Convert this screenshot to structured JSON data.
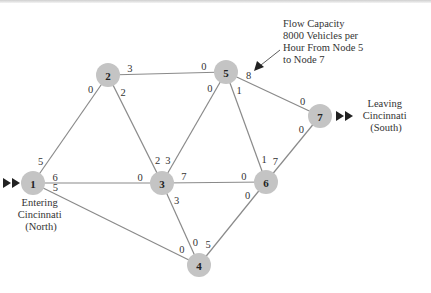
{
  "diagram": {
    "nodes": [
      {
        "id": "1",
        "x": 33,
        "y": 183
      },
      {
        "id": "2",
        "x": 108,
        "y": 75
      },
      {
        "id": "3",
        "x": 162,
        "y": 183
      },
      {
        "id": "4",
        "x": 199,
        "y": 265
      },
      {
        "id": "5",
        "x": 226,
        "y": 72
      },
      {
        "id": "6",
        "x": 266,
        "y": 182
      },
      {
        "id": "7",
        "x": 320,
        "y": 116
      }
    ],
    "edges": [
      {
        "from": "1",
        "to": "2",
        "cap_from": "5",
        "cap_to": "0"
      },
      {
        "from": "1",
        "to": "3",
        "cap_from": "6",
        "cap_to": "0"
      },
      {
        "from": "1",
        "to": "4",
        "cap_from": "5",
        "cap_to": "0"
      },
      {
        "from": "2",
        "to": "3",
        "cap_from": "2",
        "cap_to": "2"
      },
      {
        "from": "2",
        "to": "5",
        "cap_from": "3",
        "cap_to": "0"
      },
      {
        "from": "3",
        "to": "5",
        "cap_from": "3",
        "cap_to": "0"
      },
      {
        "from": "3",
        "to": "6",
        "cap_from": "7",
        "cap_to": "0"
      },
      {
        "from": "3",
        "to": "4",
        "cap_from": "3",
        "cap_to": "0"
      },
      {
        "from": "4",
        "to": "6",
        "cap_from": "5",
        "cap_to": "0"
      },
      {
        "from": "5",
        "to": "6",
        "cap_from": "1",
        "cap_to": "1"
      },
      {
        "from": "5",
        "to": "7",
        "cap_from": "8",
        "cap_to": "0"
      },
      {
        "from": "6",
        "to": "7",
        "cap_from": "7",
        "cap_to": "0"
      }
    ],
    "annotations": {
      "callout": [
        "Flow Capacity",
        "8000 Vehicles per",
        "Hour From Node 5",
        "to Node 7"
      ],
      "entering": [
        "Entering",
        "Cincinnati",
        "(North)"
      ],
      "leaving": [
        "Leaving",
        "Cincinnati",
        "(South)"
      ]
    },
    "colors": {
      "node_fill": "#c4c4c4",
      "edge": "#8a8a8a",
      "text": "#333333"
    }
  }
}
